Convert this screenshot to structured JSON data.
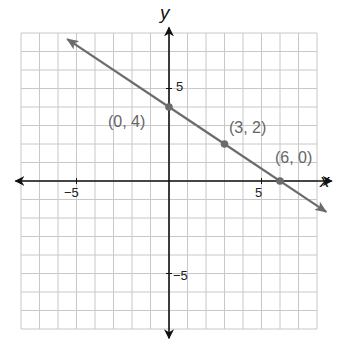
{
  "chart_data": {
    "type": "line",
    "title": "",
    "xlabel": "x",
    "ylabel": "y",
    "xlim": [
      -8.5,
      8.5
    ],
    "ylim": [
      -8.5,
      8.5
    ],
    "grid": true,
    "legend": null,
    "tick_labels": {
      "x": [
        {
          "value": -5,
          "label": "−5"
        },
        {
          "value": 5,
          "label": "5"
        }
      ],
      "y": [
        {
          "value": 5,
          "label": "5"
        },
        {
          "value": -5,
          "label": "−5"
        }
      ]
    },
    "series": [
      {
        "name": "line through (0,4), (3,2), (6,0)",
        "equation": "y = -2/3 x + 4",
        "slope": -0.6667,
        "intercept": 4,
        "x": [
          -5.5,
          8.5
        ],
        "y": [
          7.667,
          -1.667
        ],
        "arrows_both_ends": true
      }
    ],
    "points": [
      {
        "x": 0,
        "y": 4,
        "label": "(0, 4)"
      },
      {
        "x": 3,
        "y": 2,
        "label": "(3, 2)"
      },
      {
        "x": 6,
        "y": 0,
        "label": "(6, 0)"
      }
    ]
  },
  "labels": {
    "x_axis": "x",
    "y_axis": "y",
    "x_neg5": "−5",
    "x_pos5": "5",
    "y_pos5": "5",
    "y_neg5": "−5",
    "p1": "(0, 4)",
    "p2": "(3, 2)",
    "p3": "(6, 0)"
  },
  "colors": {
    "grid": "#c8c8c8",
    "axis": "#111111",
    "line": "#6b6b6b",
    "point": "#6b6b6b",
    "point_label": "#666666"
  }
}
